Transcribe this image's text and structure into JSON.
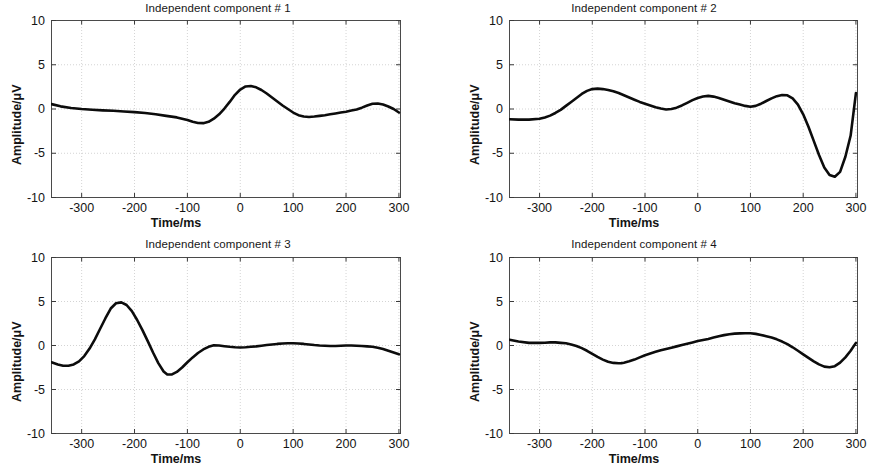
{
  "figure": {
    "background": "#ffffff",
    "trace_color": "#0c0c0c",
    "axis_color": "#4a4a4a",
    "grid_color": "#c9c9c9"
  },
  "panels": [
    {
      "id": "ic1",
      "title": "Independent component # 1",
      "xlabel": "Time/ms",
      "ylabel": "Amplitude/μV"
    },
    {
      "id": "ic2",
      "title": "Independent component # 2",
      "xlabel": "Time/ms",
      "ylabel": "Amplitude/μV"
    },
    {
      "id": "ic3",
      "title": "Independent component # 3",
      "xlabel": "Time/ms",
      "ylabel": "Amplitude/μV"
    },
    {
      "id": "ic4",
      "title": "Independent component # 4",
      "xlabel": "Time/ms",
      "ylabel": "Amplitude/μV"
    }
  ],
  "axes": {
    "xticks": [
      -300,
      -200,
      -100,
      0,
      100,
      200,
      300
    ],
    "xtick_labels": [
      "-300",
      "-200",
      "-100",
      "0",
      "100",
      "200",
      "300"
    ],
    "yticks": [
      10,
      5,
      0,
      -5,
      -10
    ],
    "ytick_labels": [
      "10",
      "5",
      "0",
      "-5",
      "-10"
    ],
    "xlim": [
      -357,
      303
    ],
    "ylim": [
      -10,
      10
    ],
    "grid": true
  },
  "chart_data": [
    {
      "type": "line",
      "title": "Independent component # 1",
      "xlabel": "Time/ms",
      "ylabel": "Amplitude/μV",
      "xlim": [
        -357,
        303
      ],
      "ylim": [
        -10,
        10
      ],
      "grid": true,
      "x": [
        -357,
        -340,
        -320,
        -300,
        -280,
        -260,
        -240,
        -220,
        -200,
        -180,
        -160,
        -140,
        -120,
        -100,
        -90,
        -80,
        -70,
        -60,
        -50,
        -40,
        -30,
        -20,
        -10,
        0,
        10,
        20,
        30,
        40,
        50,
        60,
        70,
        80,
        90,
        100,
        110,
        120,
        130,
        140,
        150,
        160,
        170,
        180,
        190,
        200,
        210,
        220,
        230,
        240,
        250,
        260,
        270,
        280,
        290,
        300
      ],
      "y": [
        0.55,
        0.3,
        0.12,
        0.0,
        -0.08,
        -0.15,
        -0.2,
        -0.28,
        -0.35,
        -0.45,
        -0.6,
        -0.78,
        -0.95,
        -1.25,
        -1.45,
        -1.58,
        -1.6,
        -1.45,
        -1.1,
        -0.6,
        0.05,
        0.8,
        1.6,
        2.2,
        2.55,
        2.6,
        2.45,
        2.15,
        1.75,
        1.3,
        0.85,
        0.4,
        0.0,
        -0.4,
        -0.7,
        -0.85,
        -0.9,
        -0.85,
        -0.78,
        -0.7,
        -0.6,
        -0.5,
        -0.4,
        -0.3,
        -0.18,
        -0.05,
        0.15,
        0.4,
        0.6,
        0.62,
        0.5,
        0.28,
        0.0,
        -0.4
      ],
      "series_name": "IC 1"
    },
    {
      "type": "line",
      "title": "Independent component # 2",
      "xlabel": "Time/ms",
      "ylabel": "Amplitude/μV",
      "xlim": [
        -357,
        303
      ],
      "ylim": [
        -10,
        10
      ],
      "grid": true,
      "x": [
        -357,
        -340,
        -320,
        -300,
        -290,
        -280,
        -270,
        -260,
        -250,
        -240,
        -230,
        -220,
        -210,
        -200,
        -190,
        -180,
        -170,
        -160,
        -150,
        -140,
        -130,
        -120,
        -110,
        -100,
        -90,
        -80,
        -70,
        -60,
        -50,
        -40,
        -30,
        -20,
        -10,
        0,
        10,
        20,
        30,
        40,
        50,
        60,
        70,
        80,
        90,
        100,
        110,
        120,
        130,
        140,
        150,
        160,
        170,
        180,
        190,
        200,
        210,
        220,
        230,
        240,
        250,
        260,
        270,
        280,
        290,
        300
      ],
      "y": [
        -1.15,
        -1.2,
        -1.2,
        -1.1,
        -0.95,
        -0.75,
        -0.45,
        -0.1,
        0.35,
        0.8,
        1.25,
        1.7,
        2.05,
        2.25,
        2.3,
        2.25,
        2.15,
        2.0,
        1.8,
        1.55,
        1.3,
        1.05,
        0.8,
        0.6,
        0.4,
        0.2,
        0.05,
        -0.05,
        0.0,
        0.15,
        0.4,
        0.7,
        1.0,
        1.25,
        1.42,
        1.48,
        1.4,
        1.25,
        1.05,
        0.85,
        0.65,
        0.5,
        0.35,
        0.25,
        0.35,
        0.6,
        0.9,
        1.2,
        1.45,
        1.58,
        1.55,
        1.2,
        0.5,
        -0.6,
        -2.0,
        -3.6,
        -5.2,
        -6.6,
        -7.45,
        -7.65,
        -7.1,
        -5.4,
        -3.0,
        1.8
      ],
      "series_name": "IC 2"
    },
    {
      "type": "line",
      "title": "Independent component # 3",
      "xlabel": "Time/ms",
      "ylabel": "Amplitude/μV",
      "xlim": [
        -357,
        303
      ],
      "ylim": [
        -10,
        10
      ],
      "grid": true,
      "x": [
        -357,
        -345,
        -335,
        -325,
        -315,
        -305,
        -295,
        -285,
        -275,
        -265,
        -255,
        -245,
        -235,
        -225,
        -215,
        -205,
        -195,
        -185,
        -175,
        -165,
        -155,
        -145,
        -138,
        -130,
        -120,
        -110,
        -100,
        -90,
        -80,
        -70,
        -60,
        -50,
        -40,
        -30,
        -20,
        -10,
        0,
        10,
        20,
        30,
        40,
        50,
        60,
        70,
        80,
        90,
        100,
        110,
        120,
        130,
        140,
        150,
        160,
        170,
        180,
        190,
        200,
        210,
        220,
        230,
        240,
        250,
        260,
        270,
        280,
        290,
        300
      ],
      "y": [
        -1.9,
        -2.15,
        -2.3,
        -2.3,
        -2.15,
        -1.8,
        -1.2,
        -0.35,
        0.7,
        1.9,
        3.1,
        4.2,
        4.8,
        4.9,
        4.6,
        3.9,
        2.9,
        1.75,
        0.5,
        -0.8,
        -2.0,
        -2.95,
        -3.3,
        -3.3,
        -3.0,
        -2.5,
        -1.9,
        -1.35,
        -0.85,
        -0.45,
        -0.15,
        0.02,
        0.0,
        -0.08,
        -0.15,
        -0.2,
        -0.22,
        -0.2,
        -0.15,
        -0.1,
        -0.03,
        0.05,
        0.12,
        0.18,
        0.22,
        0.25,
        0.25,
        0.22,
        0.18,
        0.12,
        0.05,
        0.0,
        -0.03,
        -0.05,
        -0.05,
        -0.02,
        0.0,
        0.0,
        -0.02,
        -0.05,
        -0.1,
        -0.15,
        -0.25,
        -0.4,
        -0.6,
        -0.8,
        -1.0
      ],
      "series_name": "IC 3"
    },
    {
      "type": "line",
      "title": "Independent component # 4",
      "xlabel": "Time/ms",
      "ylabel": "Amplitude/μV",
      "xlim": [
        -357,
        303
      ],
      "ylim": [
        -10,
        10
      ],
      "grid": true,
      "x": [
        -357,
        -340,
        -320,
        -300,
        -290,
        -280,
        -270,
        -260,
        -250,
        -240,
        -230,
        -220,
        -210,
        -200,
        -190,
        -180,
        -170,
        -160,
        -150,
        -145,
        -140,
        -130,
        -120,
        -110,
        -100,
        -90,
        -80,
        -70,
        -60,
        -50,
        -40,
        -30,
        -20,
        -10,
        0,
        10,
        20,
        30,
        40,
        50,
        60,
        70,
        80,
        90,
        100,
        110,
        120,
        130,
        140,
        150,
        160,
        170,
        180,
        190,
        200,
        210,
        220,
        230,
        240,
        250,
        260,
        270,
        280,
        290,
        300
      ],
      "y": [
        0.65,
        0.45,
        0.3,
        0.3,
        0.32,
        0.35,
        0.35,
        0.3,
        0.25,
        0.12,
        -0.05,
        -0.3,
        -0.6,
        -0.95,
        -1.3,
        -1.6,
        -1.85,
        -1.98,
        -2.02,
        -2.0,
        -1.95,
        -1.8,
        -1.6,
        -1.35,
        -1.1,
        -0.9,
        -0.72,
        -0.55,
        -0.4,
        -0.25,
        -0.1,
        0.05,
        0.2,
        0.35,
        0.5,
        0.62,
        0.75,
        0.9,
        1.05,
        1.18,
        1.28,
        1.35,
        1.38,
        1.4,
        1.4,
        1.32,
        1.2,
        1.05,
        0.9,
        0.7,
        0.45,
        0.15,
        -0.2,
        -0.6,
        -1.0,
        -1.4,
        -1.8,
        -2.15,
        -2.4,
        -2.48,
        -2.35,
        -1.95,
        -1.35,
        -0.6,
        0.3
      ],
      "series_name": "IC 4"
    }
  ]
}
